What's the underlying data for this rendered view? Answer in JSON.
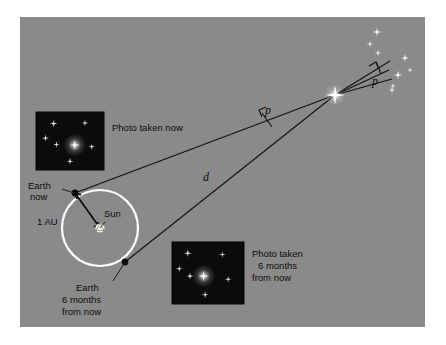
{
  "figure": {
    "background_color": "#ffffff",
    "panel_color": "#8a8a8a",
    "panel": {
      "x": 20,
      "y": 17,
      "width": 405,
      "height": 310
    }
  },
  "labels": {
    "photo_now": "Photo taken now",
    "photo_six_months_line1": "Photo taken",
    "photo_six_months_line2": "6 months",
    "photo_six_months_line3": "from now",
    "earth_now_line1": "Earth",
    "earth_now_line2": "now",
    "earth_six_months_line1": "Earth",
    "earth_six_months_line2": "6 months",
    "earth_six_months_line3": "from now",
    "sun": "Sun",
    "one_au": "1 AU",
    "distance": "d",
    "parallax_near": "p",
    "parallax_far": "p"
  },
  "geometry": {
    "target_star": {
      "x": 335,
      "y": 95
    },
    "earth_now": {
      "x": 75,
      "y": 193
    },
    "earth_six_months": {
      "x": 125,
      "y": 262
    },
    "sun": {
      "x": 100,
      "y": 228
    },
    "orbit": {
      "cx": 100,
      "cy": 228,
      "r": 38
    }
  },
  "photo_now": {
    "frame": {
      "x": 36,
      "y": 112,
      "width": 68,
      "height": 58
    },
    "background_color": "#0b0b0b",
    "stars": [
      {
        "x": 0.26,
        "y": 0.2,
        "size": 7.5,
        "bright": 1
      },
      {
        "x": 0.72,
        "y": 0.19,
        "size": 6.5,
        "bright": 1
      },
      {
        "x": 0.14,
        "y": 0.45,
        "size": 7,
        "bright": 1
      },
      {
        "x": 0.3,
        "y": 0.56,
        "size": 6.5,
        "bright": 1
      },
      {
        "x": 0.57,
        "y": 0.57,
        "size": 10,
        "bright": 1
      },
      {
        "x": 0.82,
        "y": 0.6,
        "size": 6.5,
        "bright": 1
      },
      {
        "x": 0.5,
        "y": 0.85,
        "size": 7,
        "bright": 1
      }
    ],
    "target_star_index": 4
  },
  "photo_six_months": {
    "frame": {
      "x": 172,
      "y": 242,
      "width": 72,
      "height": 62
    },
    "background_color": "#0b0b0b",
    "stars": [
      {
        "x": 0.22,
        "y": 0.18,
        "size": 7.5,
        "bright": 1
      },
      {
        "x": 0.7,
        "y": 0.2,
        "size": 6.5,
        "bright": 1
      },
      {
        "x": 0.1,
        "y": 0.43,
        "size": 6.5,
        "bright": 1
      },
      {
        "x": 0.25,
        "y": 0.55,
        "size": 7,
        "bright": 1
      },
      {
        "x": 0.44,
        "y": 0.55,
        "size": 10,
        "bright": 1
      },
      {
        "x": 0.78,
        "y": 0.6,
        "size": 6.5,
        "bright": 1
      },
      {
        "x": 0.46,
        "y": 0.85,
        "size": 7,
        "bright": 1
      }
    ],
    "target_star_index": 4
  },
  "background_star_field": {
    "stars": [
      {
        "x": 377,
        "y": 32,
        "size": 9
      },
      {
        "x": 370,
        "y": 44,
        "size": 7
      },
      {
        "x": 378,
        "y": 53,
        "size": 7
      },
      {
        "x": 405,
        "y": 58,
        "size": 8
      },
      {
        "x": 410,
        "y": 70,
        "size": 6
      },
      {
        "x": 398,
        "y": 75,
        "size": 9
      },
      {
        "x": 393,
        "y": 86,
        "size": 6
      },
      {
        "x": 392,
        "y": 90,
        "size": 7
      }
    ]
  }
}
